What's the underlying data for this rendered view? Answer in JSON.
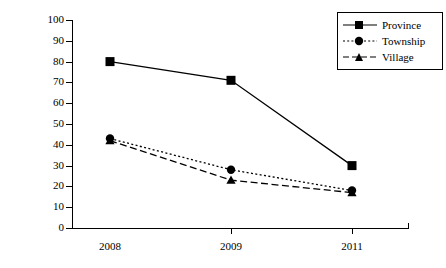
{
  "chart_data": {
    "type": "line",
    "title": "",
    "xlabel": "",
    "ylabel": "Percent",
    "categories": [
      "2008",
      "2009",
      "2011"
    ],
    "ylim": [
      0,
      100
    ],
    "yticks": [
      0,
      10,
      20,
      30,
      40,
      50,
      60,
      70,
      80,
      90,
      100
    ],
    "grid": false,
    "legend_position": "top-right",
    "series": [
      {
        "name": "Province",
        "values": [
          80,
          71,
          30
        ],
        "line_style": "solid",
        "marker": "square",
        "color": "#000000"
      },
      {
        "name": "Township",
        "values": [
          43,
          28,
          18
        ],
        "line_style": "dotted",
        "marker": "circle",
        "color": "#000000"
      },
      {
        "name": "Village",
        "values": [
          42,
          23,
          17
        ],
        "line_style": "dashed",
        "marker": "triangle",
        "color": "#000000"
      }
    ]
  },
  "axis": {
    "y_title": "Percent",
    "y_labels": [
      "100",
      "90",
      "80",
      "70",
      "60",
      "50",
      "40",
      "30",
      "20",
      "10",
      "0"
    ],
    "x_labels": [
      "2008",
      "2009",
      "2011"
    ]
  },
  "legend": {
    "entries": [
      {
        "label": "Province"
      },
      {
        "label": "Township"
      },
      {
        "label": "Village"
      }
    ]
  },
  "colors": {
    "ink": "#000000",
    "background": "#ffffff"
  }
}
